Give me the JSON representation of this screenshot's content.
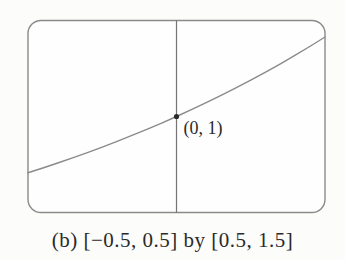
{
  "figure": {
    "point_label": "(0, 1)",
    "caption": "(b) [−0.5, 0.5] by [0.5, 1.5]"
  },
  "colors": {
    "background": "#fcfcfa",
    "viewport_fill": "#fefefe",
    "frame_stroke": "#8a8a8a",
    "axis_stroke": "#757575",
    "curve_stroke": "#8a8a8a",
    "point_fill": "#2b2b2b",
    "text": "#2a2a2a"
  },
  "chart_data": {
    "type": "line",
    "title": "",
    "xlabel": "",
    "ylabel": "",
    "caption": "(b) [−0.5, 0.5] by [0.5, 1.5]",
    "xlim": [
      -0.5,
      0.5
    ],
    "ylim": [
      0.5,
      1.5
    ],
    "grid": false,
    "axes_shown": {
      "x_axis": false,
      "y_axis": true
    },
    "legend": "none",
    "series": [
      {
        "name": "curve",
        "x": [
          -0.5,
          -0.45,
          -0.4,
          -0.35,
          -0.3,
          -0.25,
          -0.2,
          -0.15,
          -0.1,
          -0.05,
          0,
          0.05,
          0.1,
          0.15,
          0.2,
          0.25,
          0.3,
          0.35,
          0.4,
          0.45,
          0.5
        ],
        "y": [
          0.7071,
          0.732,
          0.7579,
          0.7846,
          0.8123,
          0.8409,
          0.8706,
          0.9013,
          0.933,
          0.9659,
          1.0,
          1.0353,
          1.0718,
          1.1096,
          1.1487,
          1.1892,
          1.2311,
          1.2746,
          1.3195,
          1.366,
          1.4142
        ]
      }
    ],
    "annotations": [
      {
        "text": "(0, 1)",
        "x": 0,
        "y": 1,
        "marker": "dot"
      }
    ]
  }
}
